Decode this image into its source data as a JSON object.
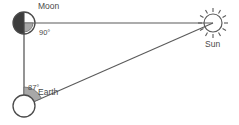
{
  "diagram": {
    "background_color": "#ffffff",
    "line_color": "#5a5a5a",
    "text_color": "#4a4a4a",
    "arc_fill_color": "#a8a8a8",
    "moon_shadow_color": "#3d3d3d",
    "bodies": [
      {
        "key": "moon",
        "label": "Moon",
        "icon": "half-moon-icon",
        "cx": 24,
        "cy": 23,
        "r": 11,
        "fill": "none",
        "shaded_half": "left",
        "label_x": 38,
        "label_y": 9
      },
      {
        "key": "sun",
        "label": "Sun",
        "icon": "sun-icon",
        "cx": 213,
        "cy": 23,
        "r": 9,
        "ray_count": 12,
        "ray_inner": 11,
        "ray_outer": 15,
        "label_x": 205,
        "label_y": 47
      },
      {
        "key": "earth",
        "label": "Earth",
        "icon": "earth-circle-icon",
        "cx": 24,
        "cy": 106,
        "r": 11,
        "fill": "none",
        "label_x": 38,
        "label_y": 95
      }
    ],
    "edges": [
      {
        "key": "moon-sun",
        "from": "moon",
        "to": "sun",
        "x1": 24,
        "y1": 23,
        "x2": 213,
        "y2": 23
      },
      {
        "key": "moon-earth",
        "from": "moon",
        "to": "earth",
        "x1": 24,
        "y1": 23,
        "x2": 24,
        "y2": 106
      },
      {
        "key": "earth-sun",
        "from": "earth",
        "to": "sun",
        "x1": 24,
        "y1": 106,
        "x2": 213,
        "y2": 23
      }
    ],
    "angles": [
      {
        "key": "moon-angle",
        "value": "90°",
        "vertex": "moon",
        "label_x": 39,
        "label_y": 35,
        "marker": "right-angle-wedge"
      },
      {
        "key": "earth-angle",
        "value": "87°",
        "vertex": "earth",
        "label_x": 28,
        "label_y": 90,
        "marker": "filled-arc-wedge"
      }
    ]
  }
}
